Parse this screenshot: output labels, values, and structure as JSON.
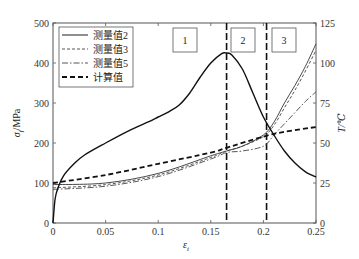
{
  "chart_data": {
    "type": "line",
    "title": "",
    "xlabel": "ε_t",
    "ylabel_left": "σ_f/MPa",
    "ylabel_right": "T/℃",
    "xlim": [
      0,
      0.25
    ],
    "ylim_left": [
      0,
      500
    ],
    "ylim_right": [
      0,
      125
    ],
    "x_ticks": [
      "0",
      "0.05",
      "0.1",
      "0.15",
      "0.2",
      "0.25"
    ],
    "y_left_ticks": [
      "0",
      "100",
      "200",
      "300",
      "400",
      "500"
    ],
    "y_right_ticks": [
      "0",
      "25",
      "50",
      "75",
      "100",
      "125"
    ],
    "grid": false,
    "legend_position": "upper left",
    "regions": [
      {
        "label": "1",
        "x_from": 0,
        "x_to": 0.165
      },
      {
        "label": "2",
        "x_from": 0.165,
        "x_to": 0.203
      },
      {
        "label": "3",
        "x_from": 0.203,
        "x_to": 0.25
      }
    ],
    "vertical_lines": [
      0.165,
      0.203
    ],
    "stress_curve": {
      "name": "σ_f",
      "axis": "left",
      "x": [
        0,
        0.002,
        0.005,
        0.01,
        0.02,
        0.03,
        0.05,
        0.07,
        0.09,
        0.1,
        0.11,
        0.12,
        0.13,
        0.14,
        0.15,
        0.16,
        0.165,
        0.17,
        0.18,
        0.19,
        0.2,
        0.21,
        0.22,
        0.23,
        0.24,
        0.25
      ],
      "values": [
        0,
        60,
        90,
        118,
        148,
        170,
        200,
        228,
        252,
        265,
        278,
        295,
        325,
        365,
        400,
        423,
        425,
        420,
        385,
        325,
        265,
        220,
        180,
        150,
        128,
        115
      ]
    },
    "series": [
      {
        "name": "测量值2",
        "axis": "right",
        "style": "solid-thin",
        "x": [
          0,
          0.05,
          0.1,
          0.15,
          0.165,
          0.18,
          0.2,
          0.21,
          0.22,
          0.23,
          0.24,
          0.25
        ],
        "values": [
          24,
          25,
          31,
          42,
          45,
          48,
          55,
          63,
          75,
          86,
          98,
          112
        ]
      },
      {
        "name": "测量值3",
        "axis": "right",
        "style": "dashed-thin",
        "x": [
          0,
          0.05,
          0.1,
          0.15,
          0.165,
          0.18,
          0.2,
          0.21,
          0.22,
          0.23,
          0.24,
          0.25
        ],
        "values": [
          22,
          24,
          30,
          41,
          45,
          48,
          54,
          61,
          72,
          83,
          95,
          108
        ]
      },
      {
        "name": "测量值5",
        "axis": "right",
        "style": "dash-dot",
        "x": [
          0,
          0.05,
          0.1,
          0.15,
          0.165,
          0.18,
          0.2,
          0.21,
          0.22,
          0.23,
          0.24,
          0.25
        ],
        "values": [
          21,
          23,
          29,
          40,
          44,
          45,
          48,
          55,
          62,
          69,
          76,
          82
        ]
      },
      {
        "name": "计算值",
        "axis": "right",
        "style": "dashed-thick",
        "x": [
          0,
          0.05,
          0.1,
          0.15,
          0.165,
          0.2,
          0.22,
          0.25
        ],
        "values": [
          25,
          30,
          37,
          44,
          47,
          54,
          57,
          60
        ]
      }
    ]
  },
  "legend": {
    "items": [
      {
        "label": "测量值2"
      },
      {
        "label": "测量值3"
      },
      {
        "label": "测量值5"
      },
      {
        "label": "计算值"
      }
    ]
  },
  "axes": {
    "xlabel_main": "ε",
    "xlabel_sub": "t",
    "ylabel_left_main": "σ",
    "ylabel_left_sub": "f",
    "ylabel_left_unit": "/MPa",
    "ylabel_right": "T/℃"
  }
}
